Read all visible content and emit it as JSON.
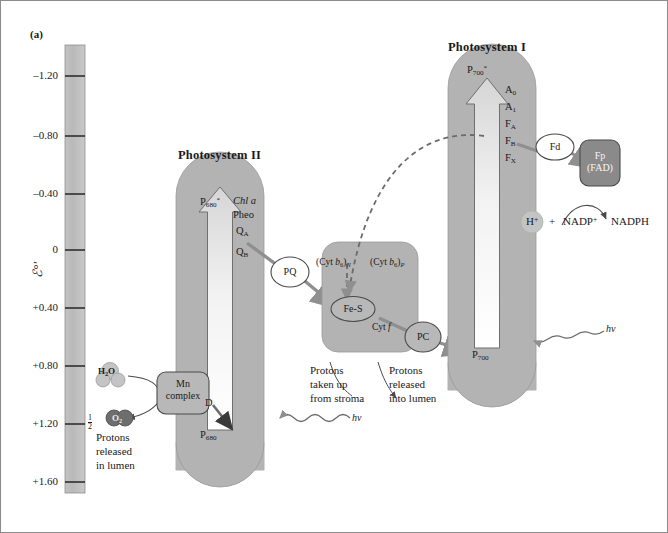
{
  "figure": {
    "panel_label": "(a)",
    "axis_title": "ℰ°'",
    "axis_ticks": [
      "–1.20",
      "–0.80",
      "–0.40",
      "0",
      "+0.40",
      "+0.80",
      "+1.20",
      "+1.60"
    ],
    "background_color": "#ffffff",
    "complex_fill": "#b3b3b3",
    "node_fill": "#ffffff",
    "dark_node_fill": "#8a8a8a",
    "arrow_color": "#8f8f8f",
    "text_color": "#1a1a1a"
  },
  "photosystem_ii": {
    "title": "Photosystem II",
    "excited_center": "P",
    "excited_center_sub": "680",
    "excited_center_star": "*",
    "ground_center": "P",
    "ground_center_sub": "680",
    "carriers": [
      "Chl a",
      "Pheo",
      "Q",
      "Q"
    ],
    "carrier_qa_sub": "A",
    "carrier_qb_sub": "B",
    "donor": "D",
    "photon": "hν"
  },
  "photosystem_i": {
    "title": "Photosystem I",
    "excited_center": "P",
    "excited_center_sub": "700",
    "excited_center_star": "*",
    "ground_center": "P",
    "ground_center_sub": "700",
    "carriers": [
      {
        "label": "A",
        "sub": "0"
      },
      {
        "label": "A",
        "sub": "1"
      },
      {
        "label": "F",
        "sub": "A"
      },
      {
        "label": "F",
        "sub": "B"
      },
      {
        "label": "F",
        "sub": "X"
      }
    ],
    "photon": "hν"
  },
  "cytochrome_complex": {
    "cyt_b6_n_pre": "(Cyt ",
    "cyt_b6_n_b": "b",
    "cyt_b6_n_b_sub": "6",
    "cyt_b6_n_post": ")",
    "cyt_b6_n_sub": "N",
    "cyt_b6_p_sub": "P",
    "fe_s": "Fe-S",
    "cyt_f_pre": "Cyt ",
    "cyt_f_italic": "f"
  },
  "mobile_carriers": {
    "pq": "PQ",
    "pc": "PC",
    "fd": "Fd",
    "fp_line1": "Fp",
    "fp_line2": "(FAD)"
  },
  "water_splitting": {
    "mn_complex_line1": "Mn",
    "mn_complex_line2": "complex",
    "water": "H",
    "water_sub": "2",
    "water_post": "O",
    "oxygen": "O",
    "oxygen_sub": "2",
    "oxygen_coefficient_num": "1",
    "oxygen_coefficient_den": "2",
    "note_line1": "Protons",
    "note_line2": "released",
    "note_line3": "in lumen"
  },
  "proton_notes": {
    "uptake_line1": "Protons",
    "uptake_line2": "taken up",
    "uptake_line3": "from stroma",
    "release_line1": "Protons",
    "release_line2": "released",
    "release_line3": "into lumen"
  },
  "nadph_reaction": {
    "proton": "H",
    "proton_charge": "+",
    "plus": "+",
    "nadp": "NADP",
    "nadp_charge": "+",
    "nadph": "NADPH"
  }
}
